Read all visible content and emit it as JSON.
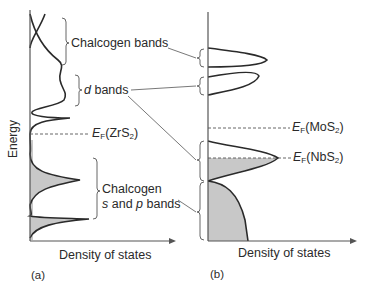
{
  "figure": {
    "y_axis_label": "Energy",
    "panel_a": {
      "tag": "(a)",
      "x_axis_label": "Density of states",
      "labels": {
        "chalcogen_bands": "Chalcogen bands",
        "d_italic": "d",
        "d_rest": " bands",
        "ef_prefix": "E",
        "ef_sub": "F",
        "ef_compound": "(ZrS",
        "ef_compound_sub": "2",
        "ef_close": ")",
        "chalcogen_sp_line1": "Chalcogen",
        "sp_s": "s",
        "sp_and": " and ",
        "sp_p": "p",
        "sp_rest": " bands"
      }
    },
    "panel_b": {
      "tag": "(b)",
      "x_axis_label": "Density of states",
      "labels": {
        "ef_mos2_prefix": "E",
        "ef_mos2_sub": "F",
        "ef_mos2_compound": "(MoS",
        "ef_mos2_compound_sub": "2",
        "ef_mos2_close": ")",
        "ef_nbs2_prefix": "E",
        "ef_nbs2_sub": "F",
        "ef_nbs2_compound": "(NbS",
        "ef_nbs2_compound_sub": "2",
        "ef_nbs2_close": ")"
      }
    },
    "colors": {
      "line": "#2a2a2a",
      "fill": "#c8c8c8",
      "axis": "#555555"
    }
  }
}
